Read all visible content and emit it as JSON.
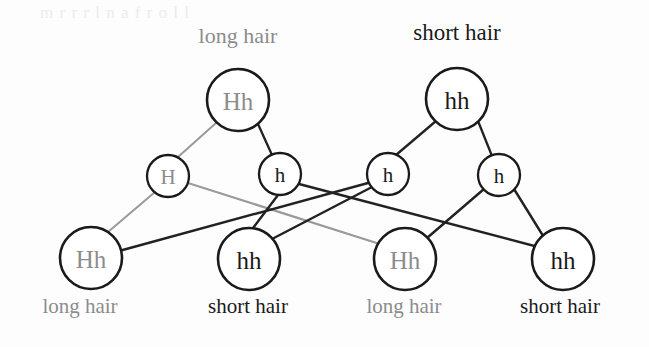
{
  "diagram": {
    "title_hidden": "Punnett-style inheritance cross diagram for hair length",
    "colors": {
      "dominant_gray": "#8c8c8c",
      "recessive_black": "#1a1a1a",
      "line_gray": "#9a9a9a",
      "line_black": "#222222",
      "circle_stroke": "#1a1a1a",
      "background": "#fdfdfd",
      "bleed_through": "#eeecea"
    },
    "bleed_text": "m  r  r  r   l  n a   f  r   o  l  l",
    "parents": [
      {
        "id": "parent-left",
        "genotype": "Hh",
        "phenotype": "long hair",
        "genotype_color": "#8c8c8c",
        "phenotype_color": "#8c8c8c",
        "cx": 238,
        "cy": 100,
        "r": 31,
        "font_size": 25,
        "label_x": 238,
        "label_y": 43,
        "label_font_size": 22
      },
      {
        "id": "parent-right",
        "genotype": "hh",
        "phenotype": "short hair",
        "genotype_color": "#1a1a1a",
        "phenotype_color": "#1a1a1a",
        "cx": 457,
        "cy": 99,
        "r": 31,
        "font_size": 25,
        "label_x": 457,
        "label_y": 38,
        "label_font_size": 23
      }
    ],
    "gametes": [
      {
        "id": "gamete-H",
        "allele": "H",
        "allele_color": "#8c8c8c",
        "cx": 168,
        "cy": 176,
        "r": 21,
        "font_size": 21
      },
      {
        "id": "gamete-h-1",
        "allele": "h",
        "allele_color": "#1a1a1a",
        "cx": 280,
        "cy": 174,
        "r": 21,
        "font_size": 21
      },
      {
        "id": "gamete-h-2",
        "allele": "h",
        "allele_color": "#1a1a1a",
        "cx": 388,
        "cy": 174,
        "r": 21,
        "font_size": 21
      },
      {
        "id": "gamete-h-3",
        "allele": "h",
        "allele_color": "#1a1a1a",
        "cx": 499,
        "cy": 175,
        "r": 21,
        "font_size": 21
      }
    ],
    "offspring": [
      {
        "id": "offspring-1",
        "genotype": "Hh",
        "phenotype": "long hair",
        "genotype_color": "#8c8c8c",
        "phenotype_color": "#8c8c8c",
        "cx": 91,
        "cy": 258,
        "r": 31,
        "font_size": 25,
        "label_x": 80,
        "label_y": 313,
        "label_font_size": 21
      },
      {
        "id": "offspring-2",
        "genotype": "hh",
        "phenotype": "short hair",
        "genotype_color": "#1a1a1a",
        "phenotype_color": "#1a1a1a",
        "cx": 249,
        "cy": 259,
        "r": 31,
        "font_size": 25,
        "label_x": 248,
        "label_y": 313,
        "label_font_size": 21
      },
      {
        "id": "offspring-3",
        "genotype": "Hh",
        "phenotype": "long hair",
        "genotype_color": "#8c8c8c",
        "phenotype_color": "#8c8c8c",
        "cx": 405,
        "cy": 259,
        "r": 31,
        "font_size": 25,
        "label_x": 404,
        "label_y": 313,
        "label_font_size": 21
      },
      {
        "id": "offspring-4",
        "genotype": "hh",
        "phenotype": "short hair",
        "genotype_color": "#1a1a1a",
        "phenotype_color": "#1a1a1a",
        "cx": 563,
        "cy": 259,
        "r": 31,
        "font_size": 25,
        "label_x": 560,
        "label_y": 313,
        "label_font_size": 21
      }
    ],
    "edges": [
      {
        "id": "edge-parentL-H",
        "from": "parent-left",
        "to": "gamete-H",
        "x1": 216,
        "y1": 123,
        "x2": 178,
        "y2": 157,
        "color": "#9a9a9a",
        "width": 2.0
      },
      {
        "id": "edge-parentL-h1",
        "from": "parent-left",
        "to": "gamete-h-1",
        "x1": 258,
        "y1": 124,
        "x2": 272,
        "y2": 155,
        "color": "#222222",
        "width": 2.3
      },
      {
        "id": "edge-parentR-h2",
        "from": "parent-right",
        "to": "gamete-h-2",
        "x1": 436,
        "y1": 121,
        "x2": 396,
        "y2": 155,
        "color": "#222222",
        "width": 2.3
      },
      {
        "id": "edge-parentR-h3",
        "from": "parent-right",
        "to": "gamete-h-3",
        "x1": 478,
        "y1": 121,
        "x2": 492,
        "y2": 156,
        "color": "#222222",
        "width": 2.3
      },
      {
        "id": "edge-H-off1",
        "from": "gamete-H",
        "to": "offspring-1",
        "x1": 155,
        "y1": 192,
        "x2": 108,
        "y2": 232,
        "color": "#9a9a9a",
        "width": 2.0
      },
      {
        "id": "edge-H-off3",
        "from": "gamete-H",
        "to": "offspring-3",
        "x1": 188,
        "y1": 183,
        "x2": 386,
        "y2": 245,
        "color": "#9a9a9a",
        "width": 2.2
      },
      {
        "id": "edge-h1-off2",
        "from": "gamete-h-1",
        "to": "offspring-2",
        "x1": 278,
        "y1": 195,
        "x2": 253,
        "y2": 228,
        "color": "#222222",
        "width": 2.4
      },
      {
        "id": "edge-h1-off4",
        "from": "gamete-h-1",
        "to": "offspring-4",
        "x1": 299,
        "y1": 184,
        "x2": 542,
        "y2": 247,
        "color": "#222222",
        "width": 2.4
      },
      {
        "id": "edge-h2-off1",
        "from": "gamete-h-2",
        "to": "offspring-1",
        "x1": 368,
        "y1": 183,
        "x2": 119,
        "y2": 251,
        "color": "#222222",
        "width": 2.4
      },
      {
        "id": "edge-h2-off2",
        "from": "gamete-h-2",
        "to": "offspring-2",
        "x1": 372,
        "y1": 187,
        "x2": 272,
        "y2": 239,
        "color": "#222222",
        "width": 2.4
      },
      {
        "id": "edge-h3-off3",
        "from": "gamete-h-3",
        "to": "offspring-3",
        "x1": 484,
        "y1": 189,
        "x2": 426,
        "y2": 238,
        "color": "#222222",
        "width": 2.4
      },
      {
        "id": "edge-h3-off4",
        "from": "gamete-h-3",
        "to": "offspring-4",
        "x1": 514,
        "y1": 189,
        "x2": 545,
        "y2": 239,
        "color": "#222222",
        "width": 2.4
      }
    ]
  }
}
